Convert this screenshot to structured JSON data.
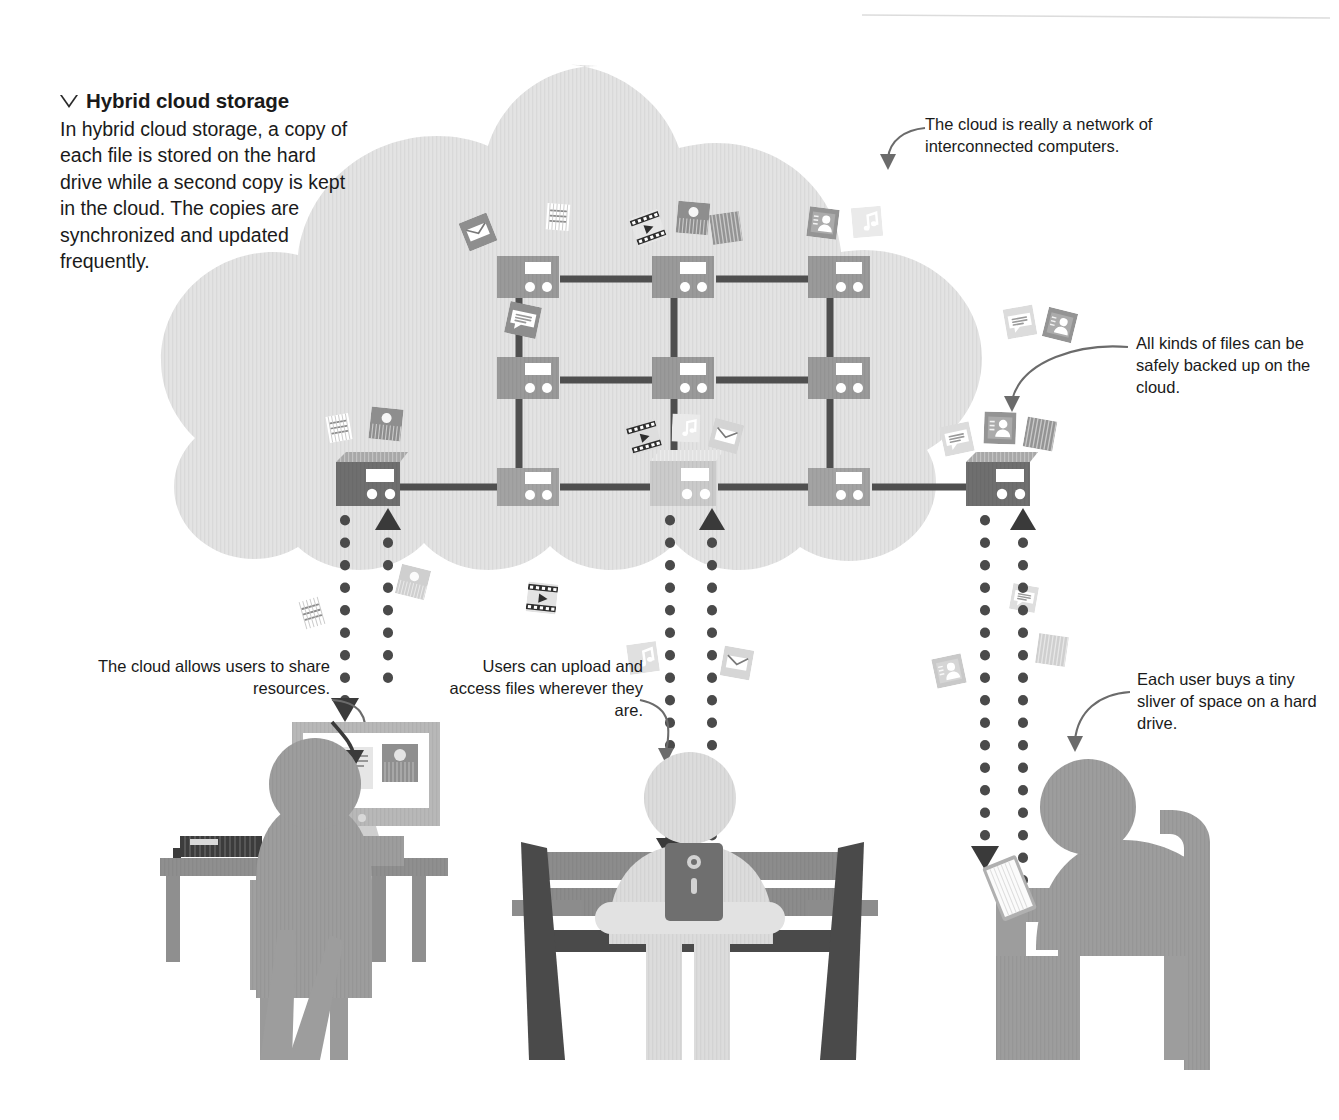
{
  "page": {
    "width": 1339,
    "height": 1120,
    "background": "#ffffff",
    "top_rule_color": "#d8d8d8"
  },
  "intro": {
    "marker_icon": "triangle-down-icon",
    "title": "Hybrid cloud storage",
    "body": "In hybrid cloud storage, a copy of each file is stored on the hard drive while a second copy is kept in the cloud. The copies are synchronized and updated frequently."
  },
  "callouts": [
    {
      "id": "network",
      "text": "The cloud is really a network of interconnected computers.",
      "align": "left"
    },
    {
      "id": "files",
      "text": "All kinds of files can be safely backed up on the cloud.",
      "align": "left"
    },
    {
      "id": "share",
      "text": "The cloud allows users to share resources.",
      "align": "right"
    },
    {
      "id": "upload",
      "text": "Users can upload and access files wherever they are.",
      "align": "right"
    },
    {
      "id": "sliver",
      "text": "Each user buys a tiny sliver of space on a hard drive.",
      "align": "left"
    }
  ],
  "colors": {
    "cloud_fill": "#e2e2e2",
    "cloud_fill_light": "#e8e8e8",
    "server_mid": "#9a9a9a",
    "server_dark": "#6f6f6f",
    "server_light": "#c8c8c8",
    "server_top_dark": "#8e8e8e",
    "server_top_light": "#d8d8d8",
    "cable": "#4f4f4f",
    "screen_white": "#ffffff",
    "arrow_dark": "#3a3a3a",
    "dots": "#4a4a4a",
    "person_mid": "#9d9d9d",
    "person_light": "#d9d9d9",
    "person_dark": "#7f7f7f",
    "bench_dark": "#4a4a4a",
    "bench_mid": "#8c8c8c",
    "desk": "#8f8f8f",
    "monitor_frame": "#b6b6b6",
    "keyboard": "#3c3c3c",
    "text": "#1a1a1a",
    "leader_line": "#6b6b6b",
    "file_icon_dark": "#8a8a8a",
    "file_icon_light": "#ececec"
  },
  "cloud_network": {
    "label": "cloud-server-network",
    "rows": [
      {
        "row": "top",
        "y": 272,
        "servers": [
          {
            "x": 497,
            "style": "mid",
            "label": "server-top-1"
          },
          {
            "x": 652,
            "style": "mid",
            "label": "server-top-2"
          },
          {
            "x": 808,
            "style": "mid",
            "label": "server-top-3"
          }
        ]
      },
      {
        "row": "middle",
        "y": 373,
        "servers": [
          {
            "x": 497,
            "style": "mid",
            "label": "server-mid-1"
          },
          {
            "x": 652,
            "style": "mid",
            "label": "server-mid-2"
          },
          {
            "x": 808,
            "style": "mid",
            "label": "server-mid-3"
          }
        ]
      },
      {
        "row": "bottom",
        "y": 482,
        "servers": [
          {
            "x": 335,
            "style": "dark-3d",
            "label": "server-bottom-1"
          },
          {
            "x": 497,
            "style": "mid",
            "label": "server-bottom-2"
          },
          {
            "x": 652,
            "style": "light-3d",
            "label": "server-bottom-3"
          },
          {
            "x": 808,
            "style": "mid",
            "label": "server-bottom-4"
          },
          {
            "x": 965,
            "style": "dark-3d",
            "label": "server-bottom-5"
          }
        ]
      }
    ]
  },
  "file_icons": [
    {
      "type": "envelope-icon",
      "x": 478,
      "y": 232,
      "size": 30,
      "rot": -22,
      "tone": "dark"
    },
    {
      "type": "document-icon",
      "x": 558,
      "y": 217,
      "size": 28,
      "rot": 4,
      "tone": "light"
    },
    {
      "type": "video-icon",
      "x": 648,
      "y": 228,
      "size": 30,
      "rot": -20,
      "tone": "dark"
    },
    {
      "type": "photo-icon",
      "x": 693,
      "y": 218,
      "size": 32,
      "rot": 5,
      "tone": "dark"
    },
    {
      "type": "image-icon",
      "x": 726,
      "y": 228,
      "size": 30,
      "rot": -8,
      "tone": "dark"
    },
    {
      "type": "contacts-icon",
      "x": 823,
      "y": 223,
      "size": 30,
      "rot": 7,
      "tone": "dark"
    },
    {
      "type": "music-icon",
      "x": 867,
      "y": 222,
      "size": 30,
      "rot": -5,
      "tone": "light"
    },
    {
      "type": "message-icon",
      "x": 523,
      "y": 320,
      "size": 32,
      "rot": 12,
      "tone": "dark"
    },
    {
      "type": "message-icon",
      "x": 1020,
      "y": 322,
      "size": 30,
      "rot": -10,
      "tone": "light"
    },
    {
      "type": "contacts-icon",
      "x": 1060,
      "y": 325,
      "size": 30,
      "rot": 14,
      "tone": "dark"
    },
    {
      "type": "document-icon",
      "x": 339,
      "y": 428,
      "size": 28,
      "rot": -10,
      "tone": "light"
    },
    {
      "type": "photo-icon",
      "x": 386,
      "y": 424,
      "size": 32,
      "rot": 6,
      "tone": "dark"
    },
    {
      "type": "video-icon",
      "x": 644,
      "y": 437,
      "size": 30,
      "rot": -16,
      "tone": "light"
    },
    {
      "type": "music-icon",
      "x": 686,
      "y": 428,
      "size": 28,
      "rot": 2,
      "tone": "light"
    },
    {
      "type": "envelope-icon",
      "x": 726,
      "y": 436,
      "size": 30,
      "rot": 15,
      "tone": "light"
    },
    {
      "type": "message-icon",
      "x": 957,
      "y": 439,
      "size": 30,
      "rot": -12,
      "tone": "light"
    },
    {
      "type": "contacts-icon",
      "x": 1000,
      "y": 428,
      "size": 32,
      "rot": 2,
      "tone": "dark"
    },
    {
      "type": "image-icon",
      "x": 1040,
      "y": 434,
      "size": 30,
      "rot": 10,
      "tone": "dark"
    },
    {
      "type": "document-icon",
      "x": 312,
      "y": 613,
      "size": 30,
      "rot": -16,
      "tone": "light"
    },
    {
      "type": "photo-icon",
      "x": 413,
      "y": 582,
      "size": 30,
      "rot": 14,
      "tone": "light"
    },
    {
      "type": "video-icon",
      "x": 542,
      "y": 598,
      "size": 30,
      "rot": 6,
      "tone": "light"
    },
    {
      "type": "music-icon",
      "x": 643,
      "y": 658,
      "size": 30,
      "rot": -8,
      "tone": "light"
    },
    {
      "type": "envelope-icon",
      "x": 737,
      "y": 663,
      "size": 30,
      "rot": 10,
      "tone": "light"
    },
    {
      "type": "contacts-icon",
      "x": 949,
      "y": 671,
      "size": 30,
      "rot": -12,
      "tone": "light"
    },
    {
      "type": "image-icon",
      "x": 1052,
      "y": 650,
      "size": 30,
      "rot": 8,
      "tone": "light"
    },
    {
      "type": "message-icon",
      "x": 1024,
      "y": 598,
      "size": 26,
      "rot": 10,
      "tone": "light"
    }
  ],
  "sync_streams": [
    {
      "label": "stream-desktop",
      "down_x": 345,
      "up_x": 388,
      "top": 505,
      "bottom": 715
    },
    {
      "label": "stream-bench",
      "down_x": 670,
      "up_x": 712,
      "top": 505,
      "bottom": 850
    },
    {
      "label": "stream-chair",
      "down_x": 985,
      "up_x": 1023,
      "top": 505,
      "bottom": 865
    }
  ],
  "people": [
    {
      "id": "desktop-user",
      "label": "person-at-desk",
      "devices": [
        "monitor",
        "keyboard",
        "desk",
        "chair"
      ],
      "screen_items": [
        "document-thumb",
        "photo-thumb"
      ]
    },
    {
      "id": "bench-user",
      "label": "person-on-bench",
      "devices": [
        "tablet",
        "bench"
      ]
    },
    {
      "id": "chair-user",
      "label": "person-in-chair",
      "devices": [
        "tablet",
        "chair"
      ]
    }
  ]
}
